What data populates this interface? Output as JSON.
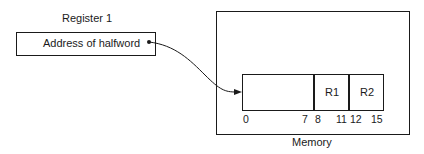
{
  "register": {
    "title": "Register 1",
    "content": "Address of halfword"
  },
  "memory": {
    "label": "Memory",
    "halfword": {
      "fields": [
        {
          "label": "",
          "bits": "0-7"
        },
        {
          "label": "R1",
          "bits": "8-11"
        },
        {
          "label": "R2",
          "bits": "12-15"
        }
      ],
      "bit_labels": [
        "0",
        "7",
        "8",
        "11",
        "12",
        "15"
      ]
    }
  },
  "arrow": {
    "from": "register-pointer-dot",
    "to": "halfword-left-edge"
  }
}
